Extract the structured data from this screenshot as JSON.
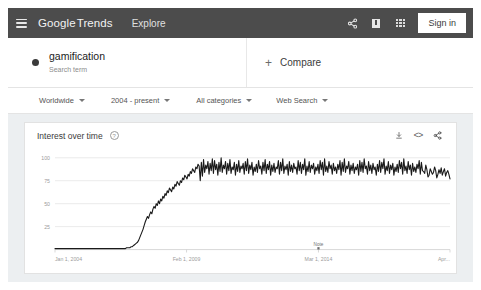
{
  "header": {
    "menu_icon": "hamburger-icon",
    "brand_google": "Google",
    "brand_trends": "Trends",
    "nav_explore": "Explore",
    "share_icon": "share-icon",
    "feedback_icon": "feedback-icon",
    "apps_icon": "apps-grid-icon",
    "signin_label": "Sign in",
    "bg_color": "#4c4c4c"
  },
  "search_term": {
    "name": "gamification",
    "subtitle": "Search term",
    "dot_color": "#3a3a3a"
  },
  "compare": {
    "plus": "+",
    "label": "Compare"
  },
  "filters": [
    {
      "label": "Worldwide"
    },
    {
      "label": "2004 - present"
    },
    {
      "label": "All categories"
    },
    {
      "label": "Web Search"
    }
  ],
  "chart_card": {
    "title": "Interest over time",
    "help_icon": "help-circle-icon",
    "help_glyph": "?",
    "download_icon": "download-icon",
    "embed_icon": "embed-code-icon",
    "embed_glyph": "<>",
    "share_icon": "share-icon"
  },
  "chart_data": {
    "type": "line",
    "title": "Interest over time",
    "xlabel": "",
    "ylabel": "",
    "ylim": [
      0,
      100
    ],
    "yticks": [
      100,
      75,
      50,
      25
    ],
    "xticks": [
      "Jan 1, 2004",
      "Feb 1, 2009",
      "Mar 1, 2014",
      "Apr..."
    ],
    "xtick_positions": [
      0.0,
      0.333,
      0.667,
      1.0
    ],
    "grid": true,
    "legend": "none",
    "line_color": "#1a1a1a",
    "annotations": [
      {
        "label": "Note",
        "x": 0.667,
        "y": 0
      }
    ],
    "series": [
      {
        "name": "gamification",
        "values": [
          1,
          1,
          1,
          1,
          1,
          1,
          1,
          1,
          1,
          1,
          1,
          1,
          1,
          1,
          1,
          1,
          1,
          1,
          1,
          1,
          1,
          1,
          1,
          1,
          1,
          1,
          1,
          1,
          1,
          1,
          1,
          1,
          1,
          1,
          1,
          1,
          1,
          1,
          1,
          1,
          1,
          1,
          1,
          1,
          1,
          1,
          1,
          1,
          1,
          1,
          1,
          1,
          1,
          1,
          1,
          1,
          1,
          1,
          1,
          1,
          1,
          1,
          1,
          1,
          1,
          2,
          2,
          2,
          2,
          3,
          3,
          4,
          5,
          6,
          7,
          8,
          10,
          13,
          16,
          19,
          22,
          26,
          30,
          33,
          36,
          34,
          38,
          41,
          39,
          44,
          47,
          45,
          50,
          48,
          53,
          50,
          55,
          53,
          58,
          56,
          61,
          59,
          64,
          62,
          67,
          65,
          63,
          68,
          66,
          71,
          69,
          74,
          72,
          70,
          75,
          73,
          78,
          76,
          81,
          79,
          77,
          82,
          80,
          85,
          83,
          88,
          86,
          84,
          90,
          88,
          93,
          91,
          75,
          95,
          80,
          98,
          84,
          92,
          88,
          96,
          82,
          94,
          86,
          99,
          83,
          97,
          87,
          93,
          81,
          95,
          85,
          100,
          84,
          92,
          88,
          96,
          82,
          94,
          86,
          98,
          83,
          90,
          87,
          95,
          81,
          93,
          85,
          97,
          84,
          91,
          88,
          94,
          82,
          96,
          86,
          99,
          83,
          92,
          87,
          95,
          81,
          90,
          85,
          93,
          84,
          97,
          88,
          91,
          82,
          95,
          86,
          98,
          83,
          93,
          87,
          96,
          81,
          92,
          85,
          94,
          84,
          90,
          88,
          97,
          82,
          95,
          86,
          99,
          83,
          91,
          87,
          93,
          81,
          96,
          85,
          92,
          84,
          94,
          88,
          90,
          82,
          97,
          86,
          95,
          83,
          93,
          87,
          99,
          81,
          91,
          85,
          96,
          84,
          92,
          88,
          94,
          82,
          90,
          86,
          93,
          83,
          97,
          87,
          95,
          81,
          99,
          85,
          91,
          84,
          96,
          88,
          92,
          82,
          94,
          86,
          90,
          83,
          93,
          87,
          97,
          81,
          95,
          85,
          99,
          84,
          91,
          88,
          96,
          82,
          92,
          86,
          94,
          83,
          90,
          87,
          93,
          81,
          97,
          85,
          95,
          84,
          99,
          88,
          91,
          82,
          96,
          86,
          92,
          83,
          94,
          87,
          90,
          81,
          93,
          85,
          97,
          84,
          95,
          88,
          99,
          82,
          91,
          86,
          96,
          83,
          92,
          87,
          94,
          81,
          90,
          85,
          93,
          84,
          97,
          88,
          95,
          82,
          99,
          86,
          91,
          83,
          96,
          87,
          92,
          81,
          94,
          85,
          90,
          84,
          93,
          88,
          97,
          82,
          95,
          86,
          85,
          83,
          92,
          87,
          79,
          81,
          88,
          85,
          82,
          84,
          90,
          86,
          78,
          82,
          87,
          83,
          89,
          81,
          85,
          88,
          80,
          84,
          86,
          82,
          77
        ]
      }
    ]
  }
}
